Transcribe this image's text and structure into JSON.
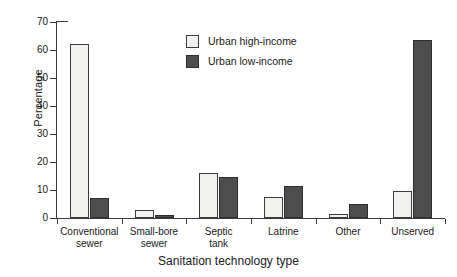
{
  "chart_data": {
    "type": "bar",
    "title": "",
    "xlabel": "Sanitation technology type",
    "ylabel": "Percentage",
    "ylim": [
      0,
      70
    ],
    "yticks": [
      0,
      10,
      20,
      30,
      40,
      50,
      60,
      70
    ],
    "grid": false,
    "legend_position": "top-center",
    "categories": [
      "Conventional sewer",
      "Small-bore sewer",
      "Septic tank",
      "Latrine",
      "Other",
      "Unserved"
    ],
    "category_lines": [
      [
        "Conventional",
        "sewer"
      ],
      [
        "Small-bore",
        "sewer"
      ],
      [
        "Septic",
        "tank"
      ],
      [
        "Latrine"
      ],
      [
        "Other"
      ],
      [
        "Unserved"
      ]
    ],
    "series": [
      {
        "name": "Urban high-income",
        "color": "#f1f1ef",
        "values": [
          62,
          3,
          16,
          7.5,
          1.5,
          9.5
        ]
      },
      {
        "name": "Urban low-income",
        "color": "#4d4d4d",
        "values": [
          7,
          1,
          14.5,
          11.5,
          5,
          63.5
        ]
      }
    ]
  },
  "axes": {
    "y_title": "Percentage",
    "x_title": "Sanitation technology type",
    "y_tick_labels": [
      "70",
      "60",
      "50",
      "40",
      "30",
      "20",
      "10",
      "0"
    ]
  },
  "legend": {
    "items": [
      {
        "label": "Urban high-income",
        "swatch": "light-swatch"
      },
      {
        "label": "Urban low-income",
        "swatch": "dark-swatch"
      }
    ]
  }
}
